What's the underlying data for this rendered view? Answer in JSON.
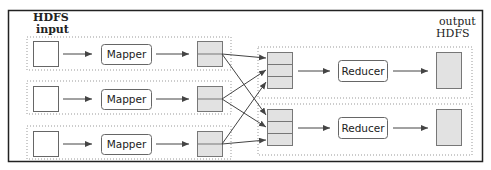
{
  "diagram": {
    "type": "mapreduce-dataflow",
    "labels": {
      "input": [
        "HDFS",
        "input"
      ],
      "output": [
        "output",
        "HDFS"
      ]
    },
    "mappers": [
      {
        "label": "Mapper"
      },
      {
        "label": "Mapper"
      },
      {
        "label": "Mapper"
      }
    ],
    "reducers": [
      {
        "label": "Reducer"
      },
      {
        "label": "Reducer"
      }
    ],
    "mapper_output_partitions": 2,
    "reducer_input_segments": 3,
    "shuffle_edges": [
      {
        "from_mapper": 1,
        "to_reducer": 1
      },
      {
        "from_mapper": 1,
        "to_reducer": 2
      },
      {
        "from_mapper": 2,
        "to_reducer": 1
      },
      {
        "from_mapper": 2,
        "to_reducer": 2
      },
      {
        "from_mapper": 3,
        "to_reducer": 1
      },
      {
        "from_mapper": 3,
        "to_reducer": 2
      }
    ],
    "colors": {
      "stroke": "#555555",
      "partition_fill": "#e2e2e2",
      "border": "#222222",
      "dotted": "#999999"
    }
  }
}
